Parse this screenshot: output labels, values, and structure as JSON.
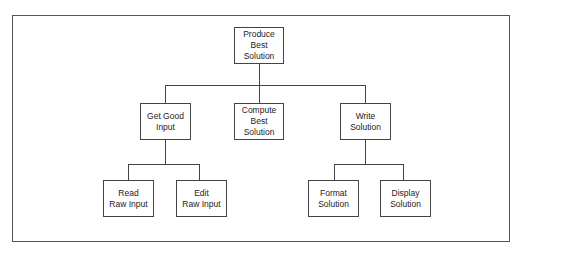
{
  "diagram": {
    "type": "hierarchy-chart",
    "root": {
      "label": "Produce Best Solution",
      "lines": [
        "Produce",
        "Best",
        "Solution"
      ]
    },
    "level2": [
      {
        "label": "Get Good Input",
        "lines": [
          "Get Good",
          "Input"
        ]
      },
      {
        "label": "Compute Best Solution",
        "lines": [
          "Compute",
          "Best",
          "Solution"
        ]
      },
      {
        "label": "Write Solution",
        "lines": [
          "Write",
          "Solution"
        ]
      }
    ],
    "level3": [
      {
        "parent": "Get Good Input",
        "label": "Read Raw Input",
        "lines": [
          "Read",
          "Raw Input"
        ]
      },
      {
        "parent": "Get Good Input",
        "label": "Edit Raw Input",
        "lines": [
          "Edit",
          "Raw Input"
        ]
      },
      {
        "parent": "Write Solution",
        "label": "Format Solution",
        "lines": [
          "Format",
          "Solution"
        ]
      },
      {
        "parent": "Write Solution",
        "label": "Display Solution",
        "lines": [
          "Display",
          "Solution"
        ]
      }
    ],
    "colors": {
      "line": "#444444",
      "background": "#ffffff",
      "text": "#222222"
    }
  }
}
